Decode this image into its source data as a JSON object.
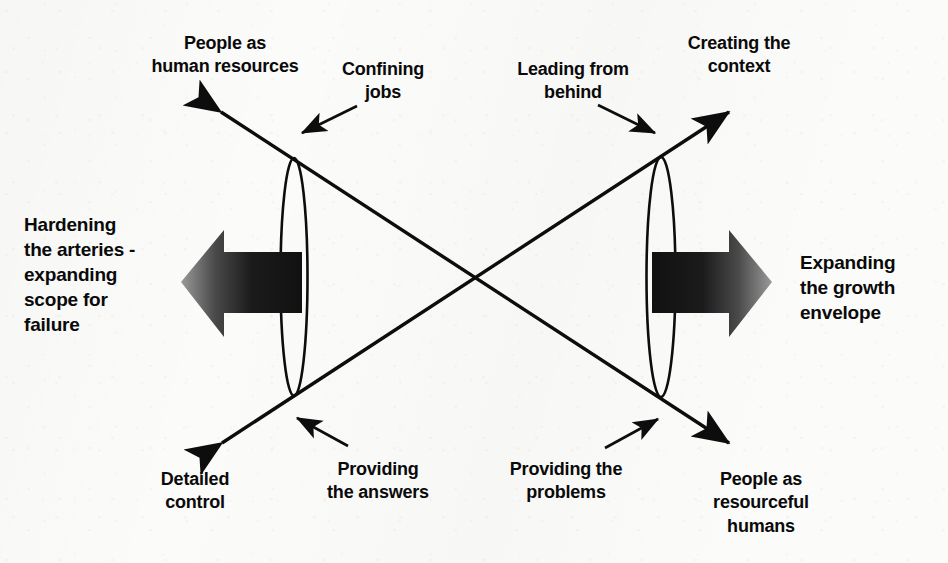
{
  "diagram": {
    "background_color": "#fbfbfa",
    "ink_color": "#0a0a0a"
  },
  "labels": {
    "top_left": "People as\nhuman resources",
    "top_left_annotation": "Confining\njobs",
    "top_right_annotation": "Leading from\nbehind",
    "top_right": "Creating the\ncontext",
    "left_outcome": "Hardening\nthe arteries -\nexpanding\nscope for\nfailure",
    "right_outcome": "Expanding\nthe growth\nenvelope",
    "bottom_left": "Detailed\ncontrol",
    "bottom_left_annotation": "Providing\nthe answers",
    "bottom_right_annotation": "Providing the\nproblems",
    "bottom_right": "People as\nresourceful\nhumans"
  },
  "arrows": {
    "left_block_arrow": {
      "direction": "left",
      "gradient_from": "#8c8c8c",
      "gradient_to": "#141414"
    },
    "right_block_arrow": {
      "direction": "right",
      "gradient_from": "#141414",
      "gradient_to": "#8c8c8c"
    },
    "diagonal_up_left": "People as human resources",
    "diagonal_down_left": "Detailed control",
    "diagonal_up_right": "Creating the context",
    "diagonal_down_right": "People as resourceful humans"
  },
  "ellipses": {
    "left_label": "left-pivot-ellipse",
    "right_label": "right-pivot-ellipse"
  }
}
